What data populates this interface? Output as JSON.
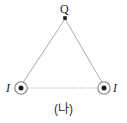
{
  "figure": {
    "caption": "(나)",
    "background_color": "#ffffff",
    "line_color": "#9a9a9a",
    "marker_color": "#1b1b1b",
    "width": 127,
    "height": 123
  },
  "labels": {
    "apex": "Q",
    "current_left": "I",
    "current_right": "I"
  },
  "points": {
    "apex": {
      "x": 65,
      "y": 18,
      "name": "point-charge-Q"
    },
    "left_wire": {
      "x": 21,
      "y": 88,
      "name": "current-out-of-page-left"
    },
    "right_wire": {
      "x": 104,
      "y": 88,
      "name": "current-out-of-page-right"
    }
  },
  "edges": {
    "left_side_style": "solid",
    "right_side_style": "solid",
    "base_style": "dotted"
  }
}
